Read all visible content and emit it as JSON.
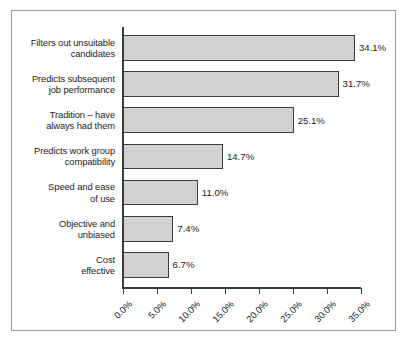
{
  "chart_data": {
    "type": "bar",
    "orientation": "horizontal",
    "title": "",
    "subtitle": "",
    "xlabel": "",
    "ylabel": "",
    "xlim": [
      0,
      35
    ],
    "grid": false,
    "legend": null,
    "categories": [
      "Filters out unsuitable\ncandidates",
      "Predicts subsequent\njob performance",
      "Tradition – have\nalways had them",
      "Predicts work group\ncompatibility",
      "Speed and ease\nof use",
      "Objective and\nunbiased",
      "Cost\neffective"
    ],
    "values": [
      34.1,
      31.7,
      25.1,
      14.7,
      11.0,
      7.4,
      6.7
    ],
    "value_labels": [
      "34.1%",
      "31.7%",
      "25.1%",
      "14.7%",
      "11.0%",
      "7.4%",
      "6.7%"
    ],
    "x_ticks": [
      0,
      5,
      10,
      15,
      20,
      25,
      30,
      35
    ],
    "x_tick_labels": [
      "0.0%",
      "5.0%",
      "10.0%",
      "15.0%",
      "20.0%",
      "25.0%",
      "30.0%",
      "35.0%"
    ],
    "colors": {
      "bar_fill": "#d2d2d2",
      "bar_border": "#3c3c3c",
      "axis": "#3a3a3a",
      "text": "#1d1d1d",
      "frame": "#9a9a9a",
      "background": "#ffffff"
    }
  }
}
